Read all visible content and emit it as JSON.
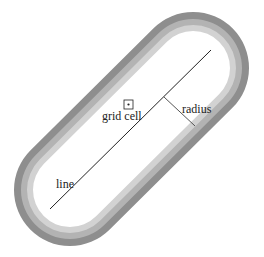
{
  "diagram": {
    "title": "",
    "labels": {
      "grid_cell": "grid cell",
      "radius": "radius",
      "line": "line"
    },
    "bands": [
      {
        "name": "outer-band",
        "color": "#8e8e8e"
      },
      {
        "name": "middle-band",
        "color": "#b3b3b3"
      },
      {
        "name": "inner-band",
        "color": "#d2d2d2"
      },
      {
        "name": "interior",
        "color": "#ffffff"
      }
    ],
    "colors": {
      "line": "#222222",
      "radius_line": "#555555",
      "grid_cell": "#222222"
    }
  }
}
